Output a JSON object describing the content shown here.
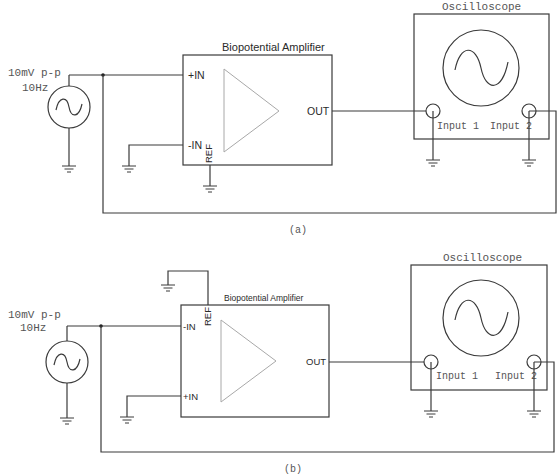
{
  "diagrams": [
    {
      "caption": "(a)",
      "source": {
        "amplitude_label": "10mV p-p",
        "frequency_label": "10Hz"
      },
      "amplifier": {
        "title": "Biopotential Amplifier",
        "pin_top": "+IN",
        "pin_bottom": "-IN",
        "pin_ref": "REF",
        "pin_out": "OUT"
      },
      "oscilloscope": {
        "title": "Oscilloscope",
        "input1": "Input 1",
        "input2": "Input 2"
      }
    },
    {
      "caption": "(b)",
      "source": {
        "amplitude_label": "10mV p-p",
        "frequency_label": "10Hz"
      },
      "amplifier": {
        "title": "Biopotential Amplifier",
        "pin_top": "-IN",
        "pin_bottom": "+IN",
        "pin_ref": "REF",
        "pin_out": "OUT"
      },
      "oscilloscope": {
        "title": "Oscilloscope",
        "input1": "Input 1",
        "input2": "Input 2"
      }
    }
  ]
}
